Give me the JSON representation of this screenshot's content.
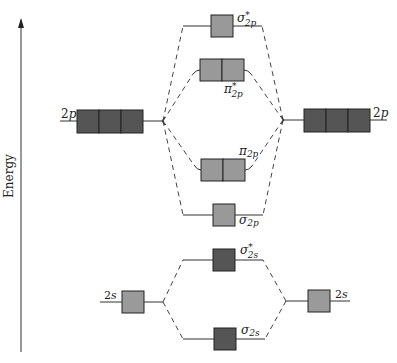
{
  "diagram": {
    "type": "molecular-orbital-energy-diagram",
    "axis_label": "Energy",
    "colors": {
      "atomic_orbital_2p": "#555555",
      "atomic_orbital_2s": "#9a9a9a",
      "mo_light": "#999999",
      "mo_dark": "#555555",
      "line": "#333333",
      "dashed": "#444444"
    },
    "left_atom": {
      "orbitals": [
        {
          "label": "2p",
          "main": "2",
          "sub": "p",
          "boxes": 3
        },
        {
          "label": "2s",
          "main": "2",
          "sub": "s",
          "boxes": 1
        }
      ]
    },
    "right_atom": {
      "orbitals": [
        {
          "label": "2p",
          "main": "2",
          "sub": "p",
          "boxes": 3
        },
        {
          "label": "2s",
          "main": "2",
          "sub": "s",
          "boxes": 1
        }
      ]
    },
    "molecular_orbitals": [
      {
        "id": "sigma_star_2p",
        "symbol": "σ",
        "star": "*",
        "sub": "2p",
        "boxes": 1
      },
      {
        "id": "pi_star_2p",
        "symbol": "π",
        "star": "*",
        "sub": "2p",
        "boxes": 2
      },
      {
        "id": "pi_2p",
        "symbol": "π",
        "star": "",
        "sub": "2p",
        "boxes": 2
      },
      {
        "id": "sigma_2p",
        "symbol": "σ",
        "star": "",
        "sub": "2p",
        "boxes": 1
      },
      {
        "id": "sigma_star_2s",
        "symbol": "σ",
        "star": "*",
        "sub": "2s",
        "boxes": 1
      },
      {
        "id": "sigma_2s",
        "symbol": "σ",
        "star": "",
        "sub": "2s",
        "boxes": 1
      }
    ]
  }
}
